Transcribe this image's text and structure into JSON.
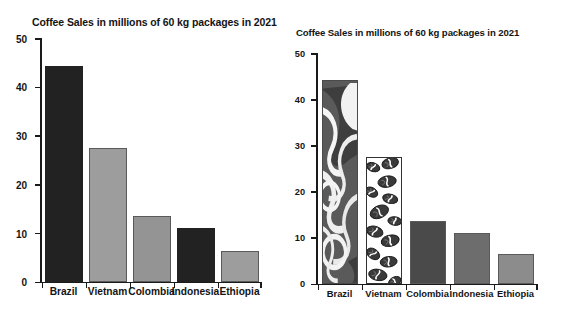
{
  "chart_data": [
    {
      "id": "left",
      "type": "bar",
      "title": "Coffee Sales in millions of 60 kg packages in 2021",
      "xlabel": "",
      "ylabel": "",
      "categories": [
        "Brazil",
        "Vietnam",
        "Colombia",
        "Indonesia",
        "Ethiopia"
      ],
      "values": [
        44.2,
        27.5,
        13.5,
        11.0,
        6.3
      ],
      "ylim": [
        0,
        50
      ],
      "yticks": [
        0,
        10,
        20,
        30,
        40,
        50
      ],
      "ytick_labels": [
        "0",
        "10",
        "20",
        "30",
        "40",
        "50"
      ],
      "grid": false,
      "legend": "none",
      "bar_fills": [
        "solid-dark",
        "solid-light-gray",
        "solid-gray",
        "solid-dark",
        "solid-gray"
      ],
      "bar_colors": [
        "#222222",
        "#9d9d9d",
        "#949494",
        "#222222",
        "#9d9d9d"
      ]
    },
    {
      "id": "right",
      "type": "bar",
      "title": "Coffee Sales in millions of 60 kg packages in 2021",
      "xlabel": "",
      "ylabel": "",
      "categories": [
        "Brazil",
        "Vietnam",
        "Colombia",
        "Indonesia",
        "Ethiopia"
      ],
      "values": [
        44.2,
        27.5,
        13.5,
        11.0,
        6.3
      ],
      "ylim": [
        0,
        50
      ],
      "yticks": [
        0,
        10,
        20,
        30,
        40,
        50
      ],
      "ytick_labels": [
        "0",
        "10",
        "20",
        "30",
        "40",
        "50"
      ],
      "grid": false,
      "legend": "none",
      "bar_fills": [
        "picture-fill-coffee-swirl",
        "picture-fill-coffee-beans",
        "solid-dark-gray",
        "solid-gray",
        "solid-light-gray"
      ],
      "bar_colors": [
        "#575757",
        "#ffffff",
        "#4a4a4a",
        "#6d6d6d",
        "#8c8c8c"
      ]
    }
  ],
  "left_chart": {
    "title": "Coffee Sales in millions of 60 kg packages in 2021",
    "yticks": [
      "50",
      "40",
      "30",
      "20",
      "10",
      "0"
    ],
    "categories": [
      "Brazil",
      "Vietnam",
      "Colombia",
      "Indonesia",
      "Ethiopia"
    ]
  },
  "right_chart": {
    "title": "Coffee Sales in millions of 60 kg packages in 2021",
    "yticks": [
      "50",
      "40",
      "30",
      "20",
      "10",
      "0"
    ],
    "categories": [
      "Brazil",
      "Vietnam",
      "Colombia",
      "Indonesia",
      "Ethiopia"
    ]
  }
}
